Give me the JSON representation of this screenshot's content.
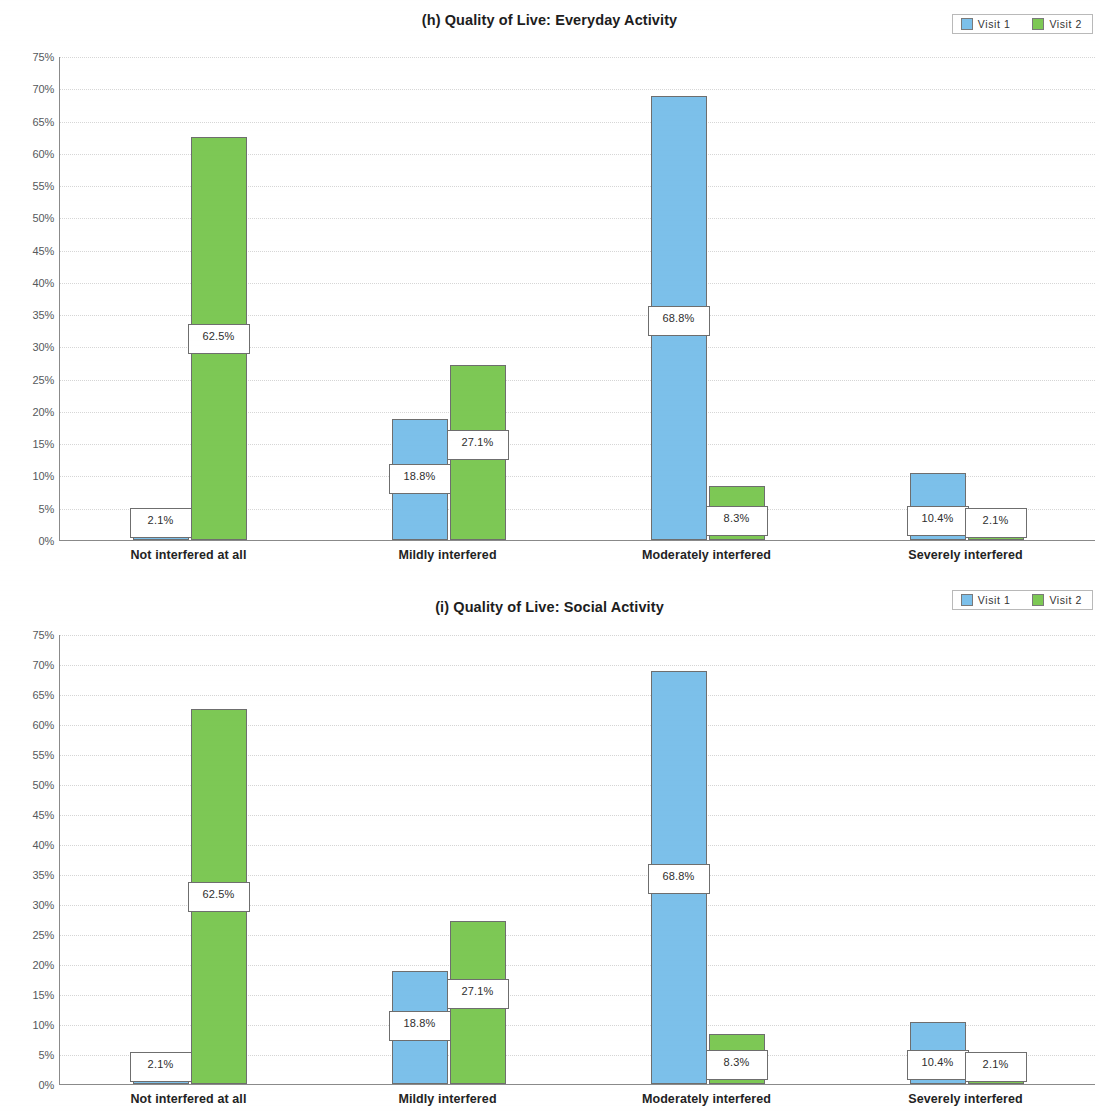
{
  "colors": {
    "visit1": "#7cc0ea",
    "visit2": "#7dc855",
    "axis": "#8a8a8a",
    "grid": "#d6d6d6",
    "text": "#2b2b2b"
  },
  "legend": {
    "items": [
      {
        "label": "Visit 1",
        "color": "#7cc0ea"
      },
      {
        "label": "Visit 2",
        "color": "#7dc855"
      }
    ]
  },
  "y_ticks": [
    "75%",
    "70%",
    "65%",
    "60%",
    "55%",
    "50%",
    "45%",
    "40%",
    "35%",
    "30%",
    "25%",
    "20%",
    "15%",
    "10%",
    "5%",
    "0%"
  ],
  "categories": [
    "Not interfered at all",
    "Mildly interfered",
    "Moderately interfered",
    "Severely interfered"
  ],
  "chart_data": [
    {
      "type": "bar",
      "title": "(h) Quality of Live: Everyday Activity",
      "xlabel": "",
      "ylabel": "",
      "ylim": [
        0,
        75
      ],
      "ytick_step": 5,
      "grid": true,
      "legend_position": "top-right",
      "categories": [
        "Not interfered at all",
        "Mildly interfered",
        "Moderately interfered",
        "Severely interfered"
      ],
      "series": [
        {
          "name": "Visit 1",
          "color": "#7cc0ea",
          "values": [
            2.1,
            18.8,
            68.8,
            10.4
          ],
          "labels": [
            "2.1%",
            "18.8%",
            "68.8%",
            "10.4%"
          ]
        },
        {
          "name": "Visit 2",
          "color": "#7dc855",
          "values": [
            62.5,
            27.1,
            8.3,
            2.1
          ],
          "labels": [
            "62.5%",
            "27.1%",
            "8.3%",
            "2.1%"
          ]
        }
      ]
    },
    {
      "type": "bar",
      "title": "(i) Quality of Live: Social Activity",
      "xlabel": "",
      "ylabel": "",
      "ylim": [
        0,
        75
      ],
      "ytick_step": 5,
      "grid": true,
      "legend_position": "top-right",
      "categories": [
        "Not interfered at all",
        "Mildly interfered",
        "Moderately interfered",
        "Severely interfered"
      ],
      "series": [
        {
          "name": "Visit 1",
          "color": "#7cc0ea",
          "values": [
            2.1,
            18.8,
            68.8,
            10.4
          ],
          "labels": [
            "2.1%",
            "18.8%",
            "68.8%",
            "10.4%"
          ]
        },
        {
          "name": "Visit 2",
          "color": "#7dc855",
          "values": [
            62.5,
            27.1,
            8.3,
            2.1
          ],
          "labels": [
            "62.5%",
            "27.1%",
            "8.3%",
            "2.1%"
          ]
        }
      ]
    }
  ]
}
